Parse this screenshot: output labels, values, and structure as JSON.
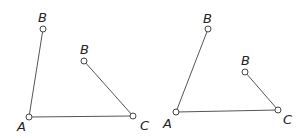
{
  "figures": [
    {
      "name": "left",
      "points": {
        "A": {
          "x": 29,
          "y": 117,
          "label": "A",
          "lx": 17,
          "ly": 131
        },
        "B_top": {
          "x": 43,
          "y": 29,
          "label": "B",
          "lx": 38,
          "ly": 22
        },
        "B_inner": {
          "x": 84,
          "y": 61,
          "label": "B",
          "lx": 80,
          "ly": 54
        },
        "C": {
          "x": 133,
          "y": 116,
          "label": "C",
          "lx": 140,
          "ly": 130
        }
      }
    },
    {
      "name": "right",
      "points": {
        "A": {
          "x": 176,
          "y": 112,
          "label": "A",
          "lx": 163,
          "ly": 128
        },
        "B_top": {
          "x": 208,
          "y": 29,
          "label": "B",
          "lx": 203,
          "ly": 23
        },
        "B_inner": {
          "x": 245,
          "y": 72,
          "label": "B",
          "lx": 241,
          "ly": 65
        },
        "C": {
          "x": 278,
          "y": 110,
          "label": "C",
          "lx": 283,
          "ly": 124
        }
      }
    }
  ]
}
